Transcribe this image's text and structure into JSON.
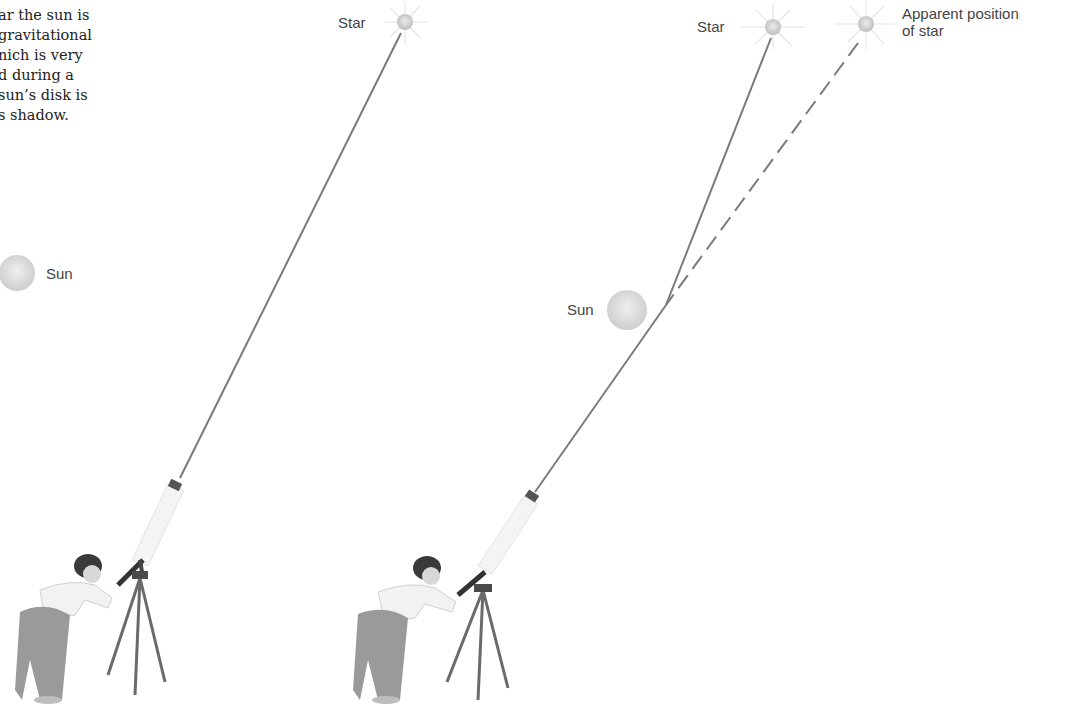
{
  "caption": {
    "lines": [
      "ar the sun is",
      "gravitational",
      "nich is very",
      "d during a",
      "sun’s disk is",
      "s shadow."
    ]
  },
  "left_panel": {
    "star_label": "Star",
    "sun_label": "Sun",
    "description": "Light from star travels in a straight line to telescope; sun is off to the side"
  },
  "right_panel": {
    "star_label": "Star",
    "sun_label": "Sun",
    "apparent_label_line1": "Apparent position",
    "apparent_label_line2": "of star",
    "description": "Light from star bends near the sun; observer sees star at apparent position (dashed line)"
  },
  "colors": {
    "ray": "#7a7a7a",
    "sun": "#d9d9d9",
    "star": "#cfcfcf",
    "text": "#444444"
  }
}
